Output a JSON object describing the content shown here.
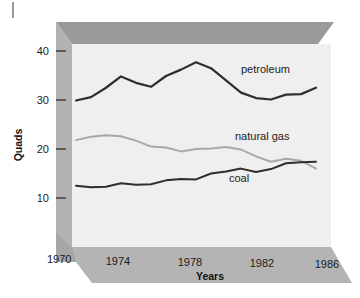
{
  "chart_data": {
    "type": "line",
    "title": "",
    "xlabel": "Years",
    "ylabel": "Quads",
    "xlim": [
      1970,
      1987
    ],
    "ylim": [
      5,
      43
    ],
    "grid": false,
    "legend_position": "inline-labels",
    "x_ticks": [
      "1970",
      "1974",
      "1978",
      "1982",
      "1986"
    ],
    "x_tick_values": [
      1970,
      1974,
      1978,
      1982,
      1986
    ],
    "y_ticks": [
      "10",
      "20",
      "30",
      "40"
    ],
    "y_tick_values": [
      10,
      20,
      30,
      40
    ],
    "x": [
      1970,
      1971,
      1972,
      1973,
      1974,
      1975,
      1976,
      1977,
      1978,
      1979,
      1980,
      1981,
      1982,
      1983,
      1984,
      1985,
      1986
    ],
    "series": [
      {
        "name": "petroleum",
        "label": "petroleum",
        "color": "#2e2e2e",
        "width": 2.2,
        "values": [
          29.9,
          30.6,
          32.5,
          34.8,
          33.5,
          32.7,
          34.9,
          36.2,
          37.7,
          36.5,
          34.0,
          31.5,
          30.4,
          30.1,
          31.1,
          31.2,
          32.5
        ]
      },
      {
        "name": "natural-gas",
        "label": "natural gas",
        "color": "#a8a8a8",
        "width": 1.9,
        "values": [
          21.8,
          22.5,
          22.8,
          22.6,
          21.7,
          20.5,
          20.3,
          19.5,
          20.0,
          20.1,
          20.4,
          19.9,
          18.5,
          17.4,
          18.0,
          17.6,
          16.0
        ]
      },
      {
        "name": "coal",
        "label": "coal",
        "color": "#2e2e2e",
        "width": 2.0,
        "values": [
          12.5,
          12.2,
          12.3,
          13.0,
          12.7,
          12.8,
          13.6,
          13.9,
          13.8,
          15.0,
          15.4,
          16.0,
          15.3,
          15.9,
          17.1,
          17.3,
          17.4
        ]
      }
    ],
    "series_label_positions": [
      {
        "name": "petroleum",
        "x": 1981.0,
        "y": 35.6
      },
      {
        "name": "natural-gas",
        "x": 1980.6,
        "y": 21.8
      },
      {
        "name": "coal",
        "x": 1980.2,
        "y": 13.3
      }
    ]
  },
  "style": {
    "plot_background": "#efefef",
    "wall_color": "#b4b4b4",
    "wall_dark": "#8f8f8f",
    "top_band_color": "#a0a0a0",
    "base_color": "#b4b4b4",
    "text_color": "#1b1b1b"
  }
}
